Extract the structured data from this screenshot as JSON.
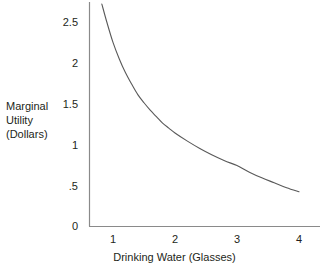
{
  "chart_data": {
    "type": "line",
    "title": "",
    "subtitle": "",
    "xlabel": "Drinking Water (Glasses)",
    "ylabel": "Marginal Utility (Dollars)",
    "ylabel_lines": [
      "Marginal",
      "Utility",
      "(Dollars)"
    ],
    "xlim": [
      0.55,
      4.35
    ],
    "ylim": [
      0,
      2.78
    ],
    "xticks": [
      1,
      2,
      3,
      4
    ],
    "xtick_labels": [
      "1",
      "2",
      "3",
      "4"
    ],
    "yticks": [
      0,
      0.5,
      1,
      1.5,
      2,
      2.5
    ],
    "ytick_labels": [
      "0",
      ".5",
      "1",
      "1.5",
      "2",
      "2.5"
    ],
    "grid": false,
    "legend": null,
    "series": [
      {
        "name": "Marginal Utility",
        "color": "#595959",
        "x": [
          0.82,
          0.9,
          1.0,
          1.1,
          1.2,
          1.3,
          1.4,
          1.5,
          1.6,
          1.7,
          1.8,
          1.9,
          2.0,
          2.2,
          2.4,
          2.6,
          2.8,
          3.0,
          3.2,
          3.4,
          3.6,
          3.8,
          4.0
        ],
        "y": [
          2.72,
          2.5,
          2.25,
          2.05,
          1.88,
          1.74,
          1.61,
          1.51,
          1.42,
          1.34,
          1.26,
          1.2,
          1.14,
          1.04,
          0.95,
          0.87,
          0.8,
          0.74,
          0.66,
          0.59,
          0.53,
          0.47,
          0.42
        ]
      }
    ],
    "axis_color": "#8a8a8a",
    "text_color": "#231f20",
    "background": "#ffffff"
  },
  "axes": {
    "x_axis_name": "drinking-water-axis",
    "y_axis_name": "marginal-utility-axis"
  }
}
